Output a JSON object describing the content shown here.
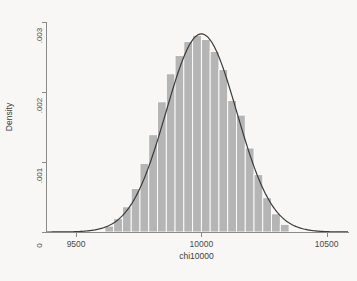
{
  "figure": {
    "background_color": "#f8f7f5",
    "plot_background_color": "#ffffff",
    "axis_color": "#8a8a8a",
    "bar_color": "#b5b5b5",
    "bar_edge_color": "#ffffff",
    "curve_color": "#3a3a3a"
  },
  "chart_data": {
    "type": "bar",
    "title": "",
    "subtitle": "",
    "xlabel": "chi10000",
    "ylabel": "Density",
    "grid": false,
    "legend": "none",
    "xlim": [
      9380,
      10585
    ],
    "ylim": [
      0,
      0.003
    ],
    "xticks": [
      9500,
      10000,
      10500
    ],
    "xtick_labels": [
      "9500",
      "10000",
      "10500"
    ],
    "yticks": [
      0,
      0.001,
      0.002,
      0.003
    ],
    "ytick_labels": [
      "0",
      ".001",
      ".002",
      ".003"
    ],
    "bin_width": 35,
    "bin_starts": [
      9615,
      9650,
      9685,
      9720,
      9755,
      9790,
      9825,
      9860,
      9895,
      9930,
      9965,
      10000,
      10035,
      10070,
      10105,
      10140,
      10175,
      10210,
      10245,
      10280,
      10315
    ],
    "categories": [
      "9615",
      "9650",
      "9685",
      "9720",
      "9755",
      "9790",
      "9825",
      "9860",
      "9895",
      "9930",
      "9965",
      "10000",
      "10035",
      "10070",
      "10105",
      "10140",
      "10175",
      "10210",
      "10245",
      "10280",
      "10315"
    ],
    "values": [
      8.5e-05,
      0.00019,
      0.00036,
      0.00062,
      0.00098,
      0.00139,
      0.00186,
      0.00226,
      0.00252,
      0.00272,
      0.00281,
      0.00275,
      0.00258,
      0.00232,
      0.00188,
      0.00167,
      0.0012,
      0.00082,
      0.00049,
      0.00026,
      0.00011
    ],
    "series": [
      {
        "name": "Density histogram",
        "kind": "bar",
        "values": [
          8.5e-05,
          0.00019,
          0.00036,
          0.00062,
          0.00098,
          0.00139,
          0.00186,
          0.00226,
          0.00252,
          0.00272,
          0.00281,
          0.00275,
          0.00258,
          0.00232,
          0.00188,
          0.00167,
          0.0012,
          0.00082,
          0.00049,
          0.00026,
          0.00011
        ]
      },
      {
        "name": "Normal density overlay",
        "kind": "line",
        "mean": 10000,
        "sd": 141,
        "peak": 0.00283
      }
    ],
    "annotations": []
  },
  "axis_titles": {
    "x": "chi10000",
    "y": "Density"
  }
}
